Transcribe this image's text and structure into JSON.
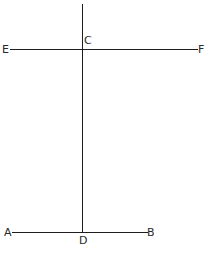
{
  "diagram": {
    "type": "geometry",
    "points": {
      "A": {
        "label": "A",
        "x": 5,
        "y": 232
      },
      "B": {
        "label": "B",
        "x": 151,
        "y": 232
      },
      "C": {
        "label": "C",
        "x": 82,
        "y": 49
      },
      "D": {
        "label": "D",
        "x": 82,
        "y": 232
      },
      "E": {
        "label": "E",
        "x": 5,
        "y": 49
      },
      "F": {
        "label": "F",
        "x": 201,
        "y": 49
      }
    },
    "segments": [
      {
        "name": "EF",
        "from": "E",
        "to": "F"
      },
      {
        "name": "AB",
        "from": "A",
        "to": "B"
      },
      {
        "name": "CD",
        "from": "C",
        "to": "D",
        "extends_above_C": true
      }
    ],
    "line_color": "#1e1e1e",
    "label_color": "#2a2a2a"
  }
}
